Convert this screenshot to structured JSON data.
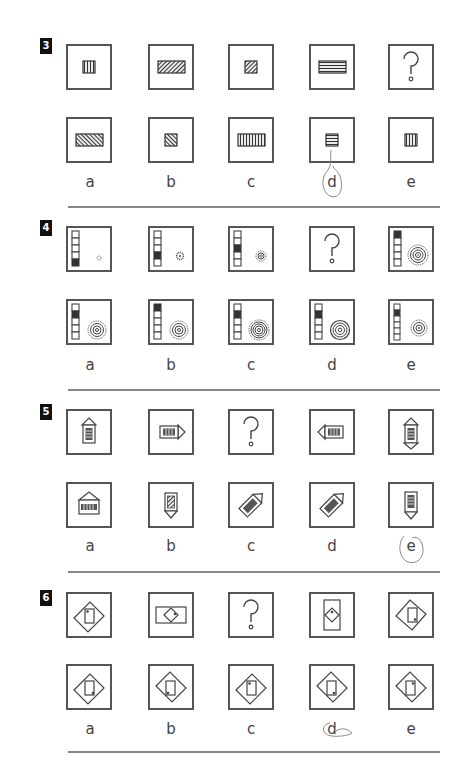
{
  "sections": [
    {
      "number": "3",
      "question_mark": "?",
      "options": [
        "a",
        "b",
        "c",
        "d",
        "e"
      ],
      "handwritten_circled": "d"
    },
    {
      "number": "4",
      "question_mark": "?",
      "options": [
        "a",
        "b",
        "c",
        "d",
        "e"
      ]
    },
    {
      "number": "5",
      "question_mark": "?",
      "options": [
        "a",
        "b",
        "c",
        "d",
        "e"
      ],
      "handwritten_circled": "e"
    },
    {
      "number": "6",
      "question_mark": "?",
      "options": [
        "a",
        "b",
        "c",
        "d",
        "e"
      ],
      "handwritten_circled": "d"
    }
  ],
  "colors": {
    "line": "#555555",
    "fill": "#333333",
    "rule": "#888888",
    "pencil": "#888888"
  }
}
